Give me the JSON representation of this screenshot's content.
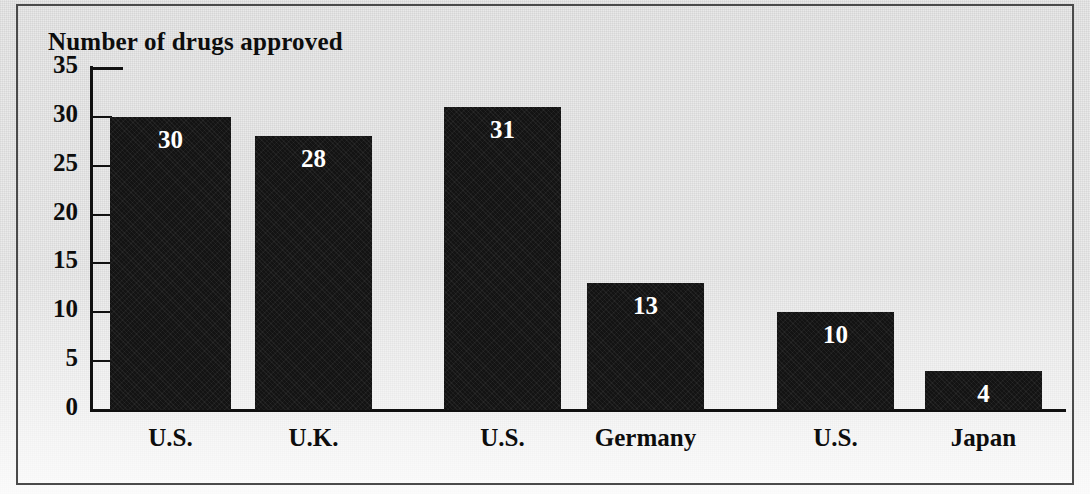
{
  "chart_data": {
    "type": "bar",
    "title": "Number of drugs approved",
    "xlabel": "",
    "ylabel": "Number of drugs approved",
    "categories": [
      "U.S.",
      "U.K.",
      "U.S.",
      "Germany",
      "U.S.",
      "Japan"
    ],
    "values": [
      30,
      28,
      31,
      13,
      10,
      4
    ],
    "value_labels": [
      "30",
      "28",
      "31",
      "13",
      "10",
      "4"
    ],
    "ylim": [
      0,
      35
    ],
    "yticks": [
      0,
      5,
      10,
      15,
      20,
      25,
      30,
      35
    ],
    "ytick_labels": [
      "0",
      "5",
      "10",
      "15",
      "20",
      "25",
      "30",
      "35"
    ],
    "grid": false,
    "legend": false,
    "legend_position": "none",
    "bar_color": "#131313",
    "value_label_color": "#ffffff",
    "axis_color": "#111111",
    "text_color": "#0d0d0d",
    "background_color": "#e9e9e9"
  }
}
